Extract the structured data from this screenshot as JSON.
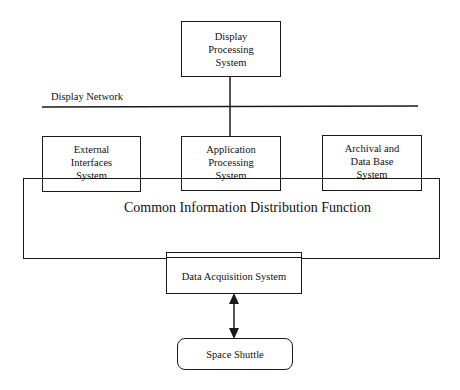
{
  "diagram": {
    "network_label": "Display Network",
    "nodes": {
      "display_processing": "Display\nProcessing\nSystem",
      "external_interfaces": "External\nInterfaces\nSystem",
      "application_processing": "Application\nProcessing\nSystem",
      "archival_database": "Archival and\nData Base\nSystem",
      "common_info": "Common Information Distribution Function",
      "data_acquisition": "Data Acquisition System",
      "space_shuttle": "Space Shuttle"
    },
    "edges": [
      {
        "from": "display_processing",
        "to": "display_network"
      },
      {
        "from": "display_network",
        "to": "application_processing"
      },
      {
        "from": "data_acquisition",
        "to": "space_shuttle",
        "type": "bidirectional-arrow"
      }
    ]
  }
}
